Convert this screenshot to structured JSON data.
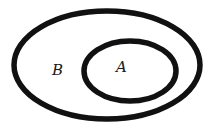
{
  "diagram": {
    "type": "venn-subset",
    "stroke_color": "#111111",
    "background": "#ffffff",
    "sets": [
      {
        "id": "B",
        "label": "B",
        "role": "outer"
      },
      {
        "id": "A",
        "label": "A",
        "role": "inner"
      }
    ]
  }
}
